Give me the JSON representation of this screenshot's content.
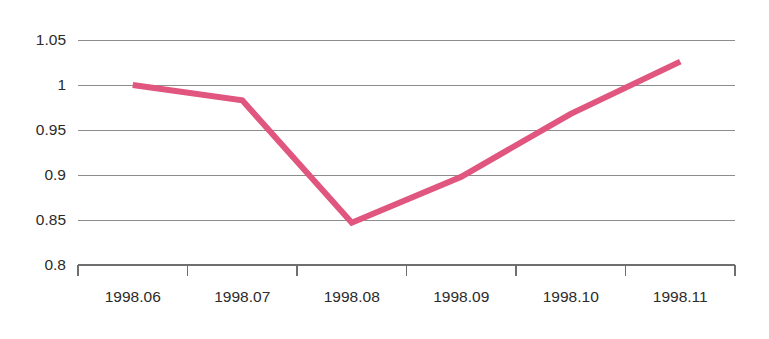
{
  "chart_data": {
    "type": "line",
    "title": "",
    "subtitle": "",
    "xlabel": "",
    "ylabel": "",
    "categories": [
      "1998.06",
      "1998.07",
      "1998.08",
      "1998.09",
      "1998.10",
      "1998.11"
    ],
    "values": [
      1.0,
      0.983,
      0.847,
      0.898,
      0.968,
      1.026
    ],
    "series": [
      {
        "name": "",
        "values": [
          1.0,
          0.983,
          0.847,
          0.898,
          0.968,
          1.026
        ]
      }
    ],
    "ylim": [
      0.8,
      1.05
    ],
    "y_ticks": [
      0.8,
      0.85,
      0.9,
      0.95,
      1,
      1.05
    ],
    "y_tick_labels": [
      "0.8",
      "0.85",
      "0.9",
      "0.95",
      "1",
      "1.05"
    ],
    "grid": true,
    "grid_axis": "y",
    "legend": false,
    "legend_position": "none",
    "annotations": [],
    "colors": {
      "line": "#e0567f",
      "grid": "#8d8d8d",
      "axis": "#6f6f6f",
      "text": "#2b2b2b",
      "background": "#ffffff"
    },
    "line_width": 6
  },
  "axes": {
    "y_labels": [
      "1.05",
      "1",
      "0.95",
      "0.9",
      "0.85",
      "0.8"
    ],
    "x_labels": [
      "1998.06",
      "1998.07",
      "1998.08",
      "1998.09",
      "1998.10",
      "1998.11"
    ]
  }
}
